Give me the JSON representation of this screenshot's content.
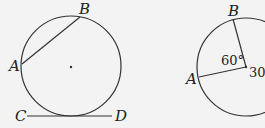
{
  "figure_left": {
    "labels": {
      "A": "A",
      "B": "B",
      "C": "C",
      "D": "D"
    },
    "description": "Circle with chord AB and tangent line CD"
  },
  "figure_right": {
    "labels": {
      "A": "A",
      "B": "B"
    },
    "angle_label": "60°",
    "radius_label": "30",
    "description": "Circle with central angle AOB of 60° and radius 30"
  },
  "colors": {
    "stroke": "#333333",
    "background": "#f3f3f3"
  }
}
